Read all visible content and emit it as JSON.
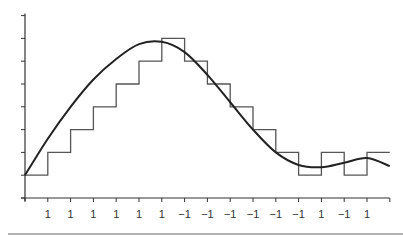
{
  "chart_data": {
    "type": "line",
    "title": "",
    "xlabel": "",
    "ylabel": "",
    "grid": false,
    "legend": null,
    "x_tick_labels": [
      "1",
      "1",
      "1",
      "1",
      "1",
      "1",
      "-1",
      "-1",
      "-1",
      "-1",
      "-1",
      "-1",
      "1",
      "-1",
      "1"
    ],
    "ylim": [
      0,
      8
    ],
    "y_ticks": [
      0,
      1,
      2,
      3,
      4,
      5,
      6,
      7,
      8
    ],
    "series": [
      {
        "name": "step-walk",
        "style": "step",
        "x": [
          0,
          1,
          2,
          3,
          4,
          5,
          6,
          7,
          8,
          9,
          10,
          11,
          12,
          13,
          14,
          15,
          16
        ],
        "values": [
          1,
          2,
          3,
          4,
          5,
          6,
          7,
          6,
          5,
          4,
          3,
          2,
          1,
          2,
          1,
          2,
          2
        ]
      },
      {
        "name": "smooth-curve",
        "style": "smooth",
        "x": [
          0,
          1,
          2,
          3,
          4,
          5,
          6,
          7,
          8,
          9,
          10,
          11,
          12,
          13,
          14,
          15,
          16
        ],
        "values": [
          1,
          2.6,
          4.0,
          5.2,
          6.1,
          6.75,
          6.85,
          6.4,
          5.4,
          4.2,
          3.0,
          2.0,
          1.45,
          1.35,
          1.55,
          1.75,
          1.4
        ]
      }
    ]
  },
  "colors": {
    "axis": "#333333",
    "step_line": "#555555",
    "curve": "#222222",
    "divider": "#9a9a9a"
  }
}
